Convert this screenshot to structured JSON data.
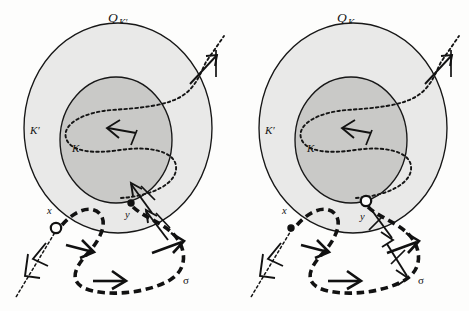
{
  "figure": {
    "kind": "mathematical-diagram",
    "background_color": "#fdfdfc",
    "ink_color": "#141414",
    "outer_fill": "#e9e9e8",
    "inner_fill": "#c9c9c7"
  },
  "panels": [
    {
      "id": "left",
      "title_base": "Q",
      "title_subscript": "K′",
      "outer_label": "K′",
      "inner_label": "K",
      "sigma_label": "σ",
      "points": [
        {
          "name": "x",
          "label": "x",
          "style": "open"
        },
        {
          "name": "y",
          "label": "y",
          "style": "filled"
        }
      ]
    },
    {
      "id": "right",
      "title_base": "Q",
      "title_subscript": "K",
      "outer_label": "K′",
      "inner_label": "K",
      "sigma_label": "σ",
      "points": [
        {
          "name": "x",
          "label": "x",
          "style": "filled"
        },
        {
          "name": "y",
          "label": "y",
          "style": "open"
        }
      ]
    }
  ]
}
